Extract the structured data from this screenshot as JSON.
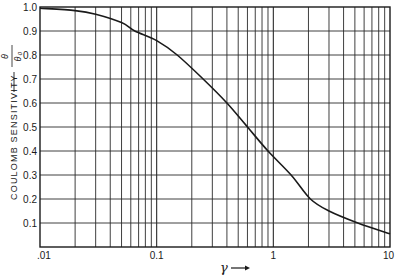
{
  "chart_data": {
    "type": "line",
    "title": "",
    "xlabel": "γ",
    "ylabel": "COULOMB SENSITIVITY — θ/θ₀",
    "ylabel_text": "COULOMB SENSITIVITY",
    "ylabel_fraction": {
      "numerator": "θ",
      "denominator": "θ₀"
    },
    "x_scale": "log",
    "xlim": [
      0.01,
      10
    ],
    "ylim": [
      0,
      1.0
    ],
    "x_ticks": [
      {
        "value": 0.01,
        "label": ".01"
      },
      {
        "value": 0.1,
        "label": "0.1"
      },
      {
        "value": 1,
        "label": "1"
      },
      {
        "value": 10,
        "label": "10"
      }
    ],
    "y_ticks": [
      {
        "value": 0.1,
        "label": "0.1"
      },
      {
        "value": 0.2,
        "label": "0.2"
      },
      {
        "value": 0.3,
        "label": "0.3"
      },
      {
        "value": 0.4,
        "label": "0.4"
      },
      {
        "value": 0.5,
        "label": "0.5"
      },
      {
        "value": 0.6,
        "label": "0.6"
      },
      {
        "value": 0.7,
        "label": "0.7"
      },
      {
        "value": 0.8,
        "label": "0.8"
      },
      {
        "value": 0.9,
        "label": "0.9"
      },
      {
        "value": 1.0,
        "label": "1.0"
      }
    ],
    "grid": true,
    "legend": null,
    "series": [
      {
        "name": "Coulomb sensitivity",
        "x": [
          0.01,
          0.02,
          0.03,
          0.05,
          0.065,
          0.1,
          0.15,
          0.25,
          0.4,
          0.6,
          0.9,
          1.42,
          2.08,
          3.0,
          5.3,
          10
        ],
        "values": [
          0.995,
          0.985,
          0.97,
          0.935,
          0.9,
          0.86,
          0.8,
          0.7,
          0.6,
          0.5,
          0.4,
          0.3,
          0.2,
          0.15,
          0.1,
          0.055
        ]
      }
    ],
    "colors": {
      "line": "#1a1a1a",
      "grid": "#2a2a2a",
      "background": "#ffffff"
    }
  }
}
